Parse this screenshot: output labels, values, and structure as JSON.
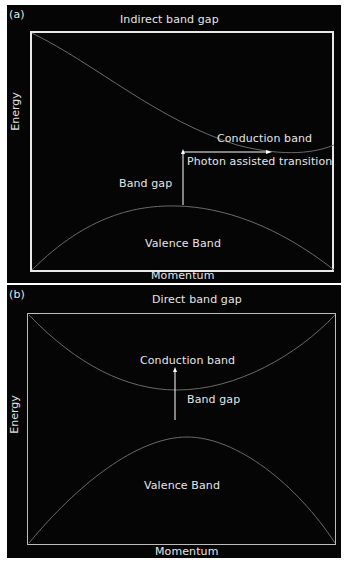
{
  "panels": [
    {
      "tag": "(a)",
      "title": "Indirect band gap",
      "ylabel": "Energy",
      "xlabel": "Momentum",
      "labels": {
        "conduction": "Conduction band",
        "valence": "Valence Band",
        "gap": "Band gap",
        "transition": "Photon assisted transition"
      }
    },
    {
      "tag": "(b)",
      "title": "Direct band gap",
      "ylabel": "Energy",
      "xlabel": "Momentum",
      "labels": {
        "conduction": "Conduction band",
        "valence": "Valence Band",
        "gap": "Band gap"
      }
    }
  ],
  "colors": {
    "background": "#050505",
    "frame": "#e8e8e8",
    "text": "#e6e6e6",
    "curve": "#6a6a6a",
    "arrow": "#ffffff"
  }
}
